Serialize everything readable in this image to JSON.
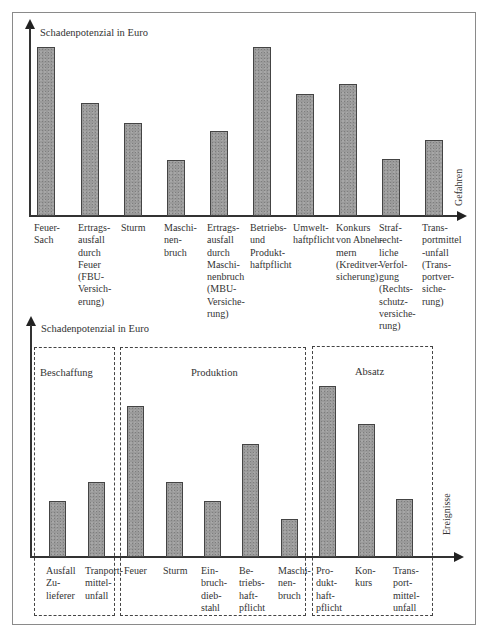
{
  "chart_data": [
    {
      "type": "bar",
      "title": "",
      "ylabel": "Schadenpotenzial in Euro",
      "xlabel": "Gefahren",
      "grid": false,
      "categories": [
        "Feuer-Sach",
        "Ertragsausfall durch Feuer (FBU-Versicherung)",
        "Sturm",
        "Maschinenbruch",
        "Ertragsausfall durch Maschinenbruch (MBU-Versicherung)",
        "Betriebs- und Produkthaftpflicht",
        "Umwelthaftpflicht",
        "Konkurs von Abnehmern (Kreditversicherung)",
        "Strafrechtliche Verfolgung (Rechtsschutzversicherung)",
        "Transportmittel-unfall (Transportversicherung)"
      ],
      "values": [
        100,
        67,
        55,
        33,
        50,
        100,
        72,
        78,
        34,
        45
      ],
      "note": "Relative bar heights (no numeric axis shown)"
    },
    {
      "type": "bar",
      "title": "",
      "ylabel": "Schadenpotenzial in Euro",
      "xlabel": "Ereignisse",
      "grid": false,
      "groups": [
        {
          "name": "Beschaffung",
          "categories": [
            "Ausfall Zulieferer",
            "Tranportmittelunfall"
          ],
          "values": [
            33,
            44
          ]
        },
        {
          "name": "Produktion",
          "categories": [
            "Feuer",
            "Sturm",
            "Einbruchdiebstahl",
            "Betriebshaftpflicht",
            "Maschinenbruch"
          ],
          "values": [
            88,
            44,
            33,
            66,
            22
          ]
        },
        {
          "name": "Absatz",
          "categories": [
            "Produkthaftpflicht",
            "Konkurs",
            "Transportmittelunfall"
          ],
          "values": [
            100,
            78,
            34
          ]
        }
      ],
      "note": "Relative bar heights (no numeric axis shown)"
    }
  ],
  "top": {
    "ylabel": "Schadenpotenzial in Euro",
    "xlabel": "Gefahren",
    "bars": [
      {
        "label": "Feuer-\nSach",
        "x": 37,
        "top": 47
      },
      {
        "label": "Ertrags-\nausfall\ndurch\nFeuer\n(FBU-\nVersich-\nerung)",
        "x": 81,
        "top": 103
      },
      {
        "label": "Sturm",
        "x": 124,
        "top": 123
      },
      {
        "label": "Maschi-\nnen-\nbruch",
        "x": 167,
        "top": 160
      },
      {
        "label": "Ertrags-\nausfall\ndurch\nMaschi-\nnenbruch\n(MBU-\nVersiche-\nrung)",
        "x": 210,
        "top": 131
      },
      {
        "label": "Betriebs-\nund\nProdukt-\nhaftpflicht",
        "x": 253,
        "top": 47
      },
      {
        "label": "Umwelt-\nhaftpflicht",
        "x": 296,
        "top": 94
      },
      {
        "label": "Konkurs\nvon Abneh-\nmern\n(Kreditver-\nsicherung)",
        "x": 339,
        "top": 84
      },
      {
        "label": "Straf-\nrecht-\nliche\nVerfol-\ngung\n(Rechts-\nschutz-\nversiche-\nrung)",
        "x": 382,
        "top": 159
      },
      {
        "label": "Trans-\nportmittel\n-unfall\n(Trans-\nportver-\nsiche-\nrung)",
        "x": 425,
        "top": 140
      }
    ]
  },
  "bottom": {
    "ylabel": "Schadenpotenzial in Euro",
    "xlabel": "Ereignisse",
    "groups": [
      {
        "name": "Beschaffung"
      },
      {
        "name": "Produktion"
      },
      {
        "name": "Absatz"
      }
    ],
    "bars": [
      {
        "label": "Ausfall\nZu-\nlieferer",
        "x": 49,
        "top": 501
      },
      {
        "label": "Tranport-\nmittel-\nunfall",
        "x": 88,
        "top": 482
      },
      {
        "label": "Feuer",
        "x": 127,
        "top": 406
      },
      {
        "label": "Sturm",
        "x": 166,
        "top": 482
      },
      {
        "label": "Ein-\nbruch-\ndieb-\nstahl",
        "x": 204,
        "top": 501
      },
      {
        "label": "Be-\ntriebs-\nhaft-\npflicht",
        "x": 242,
        "top": 444
      },
      {
        "label": "Maschi-\nnen-\nbruch",
        "x": 281,
        "top": 519
      },
      {
        "label": "Pro-\ndukt-\nhaft-\npflicht",
        "x": 319,
        "top": 386
      },
      {
        "label": "Kon-\nkurs",
        "x": 358,
        "top": 424
      },
      {
        "label": "Trans-\nport-\nmittel-\nunfall",
        "x": 396,
        "top": 499
      }
    ]
  }
}
